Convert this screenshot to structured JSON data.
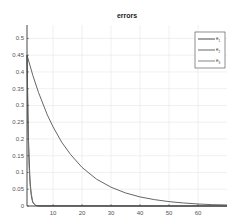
{
  "chart_data": {
    "type": "line",
    "title": "errors",
    "xlabel": "",
    "ylabel": "",
    "xlim": [
      1,
      70
    ],
    "ylim": [
      0,
      0.54
    ],
    "grid": true,
    "legend_position": "upper right",
    "x_ticks": [
      10,
      20,
      30,
      40,
      50,
      60
    ],
    "y_ticks": [
      0,
      0.05,
      0.1,
      0.15,
      0.2,
      0.25,
      0.3,
      0.35,
      0.4,
      0.45,
      0.5
    ],
    "x_tick_labels": [
      "10",
      "20",
      "30",
      "40",
      "50",
      "60"
    ],
    "y_tick_labels": [
      "0",
      "0.05",
      "0.1",
      "0.15",
      "0.2",
      "0.25",
      "0.3",
      "0.35",
      "0.4",
      "0.45",
      "0.5"
    ],
    "series": [
      {
        "name": "e1",
        "label_main": "e",
        "label_sub": "1",
        "color": "#333333",
        "x": [
          1,
          1.5,
          2,
          2.5,
          3,
          4,
          5,
          70
        ],
        "y": [
          0.45,
          0.2,
          0.08,
          0.03,
          0.01,
          0.002,
          0,
          0
        ]
      },
      {
        "name": "e2",
        "label_main": "e",
        "label_sub": "2",
        "color": "#555555",
        "x": [
          1,
          3,
          5,
          8,
          10,
          13,
          16,
          20,
          25,
          30,
          35,
          40,
          45,
          50,
          55,
          60,
          65,
          70
        ],
        "y": [
          0.45,
          0.39,
          0.338,
          0.272,
          0.236,
          0.19,
          0.154,
          0.115,
          0.08,
          0.056,
          0.039,
          0.027,
          0.019,
          0.013,
          0.009,
          0.006,
          0.004,
          0.003
        ]
      },
      {
        "name": "e3",
        "label_main": "e",
        "label_sub": "3",
        "color": "#777777",
        "x": [
          1,
          1.3,
          1.7,
          2.2,
          3,
          4,
          70
        ],
        "y": [
          0.45,
          0.25,
          0.12,
          0.05,
          0.012,
          0.001,
          0
        ]
      }
    ]
  }
}
